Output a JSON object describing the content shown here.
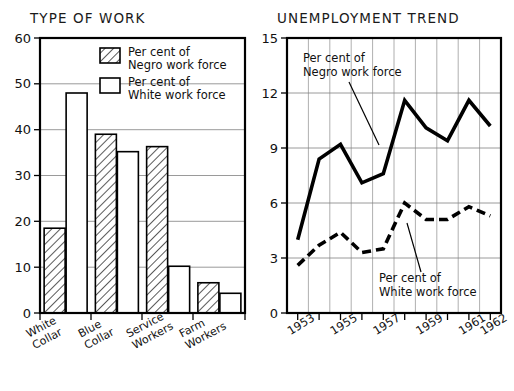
{
  "page": {
    "width": 514,
    "height": 391,
    "background": "#ffffff",
    "ink": "#000000"
  },
  "charts": {
    "bar": {
      "title": "TYPE OF WORK",
      "legend": [
        {
          "key": "negro",
          "swatch": "hatched",
          "line1": "Per cent of",
          "line2": "Negro work force"
        },
        {
          "key": "white",
          "swatch": "open",
          "line1": "Per cent of",
          "line2": "White work force"
        }
      ],
      "y_ticks": [
        "0",
        "10",
        "20",
        "30",
        "40",
        "50",
        "60"
      ],
      "categories": [
        {
          "line1": "White",
          "line2": "Collar"
        },
        {
          "line1": "Blue",
          "line2": "Collar"
        },
        {
          "line1": "Service",
          "line2": "Workers"
        },
        {
          "line1": "Farm",
          "line2": "Workers"
        }
      ]
    },
    "line": {
      "title": "UNEMPLOYMENT TREND",
      "y_ticks": [
        "0",
        "3",
        "6",
        "9",
        "12",
        "15"
      ],
      "x_labels": [
        "1953",
        "1955",
        "1957",
        "1959",
        "1961",
        "1962"
      ],
      "annotations": [
        {
          "key": "negro",
          "line1": "Per cent of",
          "line2": "Negro work force"
        },
        {
          "key": "white",
          "line1": "Per cent of",
          "line2": "White work force"
        }
      ]
    }
  },
  "chart_data": [
    {
      "type": "bar",
      "title": "TYPE OF WORK",
      "xlabel": "",
      "ylabel": "",
      "ylim": [
        0,
        60
      ],
      "yticks": [
        0,
        10,
        20,
        30,
        40,
        50,
        60
      ],
      "grid": true,
      "legend_position": "inside-top-right",
      "categories": [
        "White Collar",
        "Blue Collar",
        "Service Workers",
        "Farm Workers"
      ],
      "series": [
        {
          "name": "Per cent of Negro work force",
          "style": "hatched",
          "values": [
            18.5,
            39.0,
            36.3,
            6.6
          ]
        },
        {
          "name": "Per cent of White work force",
          "style": "open",
          "values": [
            48.0,
            35.2,
            10.2,
            4.3
          ]
        }
      ]
    },
    {
      "type": "line",
      "title": "UNEMPLOYMENT TREND",
      "xlabel": "",
      "ylabel": "",
      "ylim": [
        0,
        15
      ],
      "yticks": [
        0,
        3,
        6,
        9,
        12,
        15
      ],
      "grid": true,
      "legend_position": "inline-annotation",
      "x": [
        1953,
        1954,
        1955,
        1956,
        1957,
        1958,
        1959,
        1960,
        1961,
        1962
      ],
      "xtick_labels": [
        "1953",
        "1955",
        "1957",
        "1959",
        "1961",
        "1962"
      ],
      "series": [
        {
          "name": "Per cent of Negro work force",
          "style": "solid",
          "values": [
            4.0,
            8.4,
            9.2,
            7.1,
            7.6,
            11.6,
            10.1,
            9.4,
            11.6,
            10.2
          ]
        },
        {
          "name": "Per cent of White work force",
          "style": "dashed",
          "values": [
            2.6,
            3.7,
            4.4,
            3.3,
            3.5,
            6.0,
            5.1,
            5.1,
            5.8,
            5.3
          ]
        }
      ]
    }
  ]
}
